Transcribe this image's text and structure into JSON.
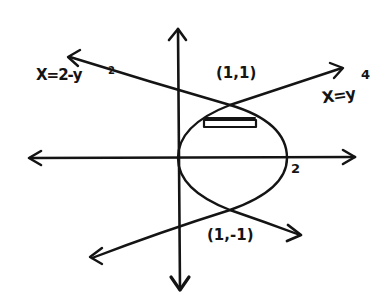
{
  "diagram": {
    "ink_color": "#141414",
    "background": "#ffffff",
    "curves": [
      {
        "id": "parabola",
        "equation_label": "X=2-y",
        "exponent": "2",
        "shape": "leftward-opening parabola, vertex (2,0)"
      },
      {
        "id": "quartic",
        "equation_label": "X=y",
        "exponent": "4",
        "shape": "rightward-opening curve x=y^4, vertex (0,0)"
      }
    ],
    "points": [
      {
        "label": "(1,1)",
        "x": 1,
        "y": 1
      },
      {
        "label": "(1,-1)",
        "x": 1,
        "y": -1
      }
    ],
    "axis_ticks": [
      {
        "label": "2",
        "axis": "x",
        "value": 2
      }
    ],
    "strip": {
      "type": "horizontal rectangle",
      "between": "x=y^4 and x=2-y^2",
      "near_y": 0.7
    }
  }
}
